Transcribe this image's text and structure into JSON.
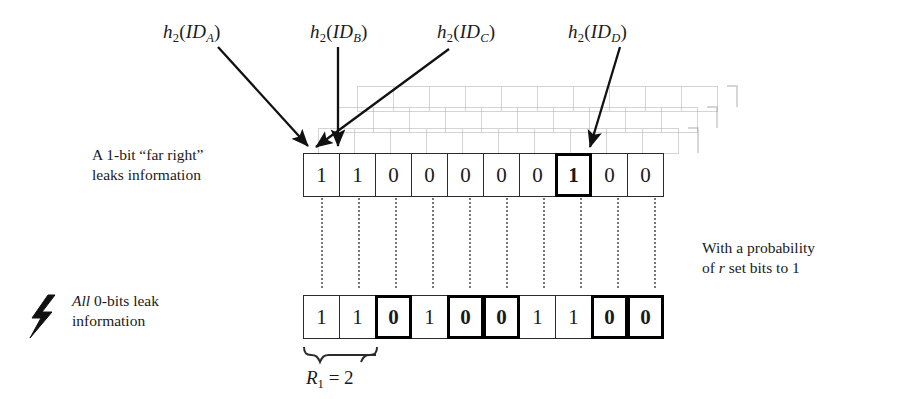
{
  "figure": {
    "hash_labels": [
      {
        "fn": "h",
        "fn_sub": "2",
        "arg": "ID",
        "arg_sub": "A",
        "text": "h2(IDA)",
        "x": 163,
        "y": 22
      },
      {
        "fn": "h",
        "fn_sub": "2",
        "arg": "ID",
        "arg_sub": "B",
        "text": "h2(IDB)",
        "x": 310,
        "y": 22
      },
      {
        "fn": "h",
        "fn_sub": "2",
        "arg": "ID",
        "arg_sub": "C",
        "text": "h2(IDC)",
        "x": 437,
        "y": 22
      },
      {
        "fn": "h",
        "fn_sub": "2",
        "arg": "ID",
        "arg_sub": "D",
        "text": "h2(IDD)",
        "x": 568,
        "y": 22
      }
    ],
    "captions": {
      "top_left": {
        "line1": "A 1-bit “far right”",
        "line2": "leaks information"
      },
      "bottom_left": {
        "line1_italic": "All",
        "line1_rest": " 0-bits leak",
        "line2": "information"
      },
      "right": {
        "line1": "With a probability",
        "line2_pre": "of ",
        "line2_italic": "r",
        "line2_post": " set bits to 1"
      }
    },
    "icons": {
      "bolt": "lightning-bolt-icon"
    },
    "rows": [
      {
        "name": "top-bit-array",
        "bits": [
          "1",
          "1",
          "0",
          "0",
          "0",
          "0",
          "0",
          "1",
          "0",
          "0"
        ],
        "highlighted": [
          7
        ]
      },
      {
        "name": "bottom-bit-array",
        "bits": [
          "1",
          "1",
          "0",
          "1",
          "0",
          "0",
          "1",
          "1",
          "0",
          "0"
        ],
        "highlighted": [
          2,
          4,
          5,
          8,
          9
        ]
      }
    ],
    "brace": {
      "label_var": "R",
      "label_sub": "1",
      "label_eq": " = ",
      "label_val": "2",
      "spans_cells": 2
    },
    "colors": {
      "ink": "#1a1a1a",
      "cell_border": "#2b2b2b",
      "highlight_border": "#000000",
      "ghost": "#9a9a9a",
      "dotted": "#777777"
    }
  }
}
